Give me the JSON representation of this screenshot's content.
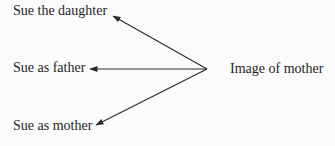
{
  "diagram": {
    "source_node": {
      "label": "Image of mother"
    },
    "target_nodes": [
      {
        "label": "Sue the daughter"
      },
      {
        "label": "Sue as father"
      },
      {
        "label": "Sue as mother"
      }
    ],
    "edges": [
      {
        "from": "Image of mother",
        "to": "Sue the daughter",
        "type": "arrow"
      },
      {
        "from": "Image of mother",
        "to": "Sue as father",
        "type": "arrow"
      },
      {
        "from": "Image of mother",
        "to": "Sue as mother",
        "type": "arrow"
      }
    ],
    "colors": {
      "background": "#fbfbfb",
      "text": "#1e1e1e",
      "line": "#2a2a2a"
    }
  }
}
